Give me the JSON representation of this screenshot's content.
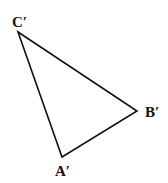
{
  "figure": {
    "type": "triangle",
    "stroke_color": "#111111",
    "background": "#ffffff",
    "vertices": [
      {
        "id": "C",
        "label": "C′",
        "x": 18,
        "y": 32
      },
      {
        "id": "B",
        "label": "B′",
        "x": 137,
        "y": 111
      },
      {
        "id": "A",
        "label": "A′",
        "x": 62,
        "y": 157
      }
    ],
    "edges": [
      {
        "from": "C",
        "to": "B"
      },
      {
        "from": "B",
        "to": "A"
      },
      {
        "from": "A",
        "to": "C"
      }
    ]
  }
}
